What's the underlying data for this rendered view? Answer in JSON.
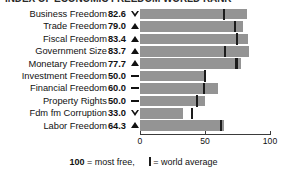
{
  "title": "INDEX OF ECONOMIC FREEDOM WORLD RANK",
  "footer": {
    "score_value": "100",
    "score_text": " = most free,",
    "legend_icon": "world-average-marker",
    "legend_text": "= world average"
  },
  "axis": {
    "min": 0,
    "max": 100,
    "ticks": [
      "0",
      "50",
      "100"
    ],
    "tick_values": [
      0,
      50,
      100
    ]
  },
  "chart_data": {
    "type": "bar",
    "title": "INDEX OF ECONOMIC FREEDOM WORLD RANK",
    "xlabel": "",
    "ylabel": "",
    "xlim": [
      0,
      100
    ],
    "grid": false,
    "legend": "100 = most free, | = world average",
    "orientation": "horizontal",
    "categories": [
      "Business Freedom",
      "Trade Freedom",
      "Fiscal Freedom",
      "Government Size",
      "Monetary Freedom",
      "Investment Freedom",
      "Financial Freedom",
      "Property Rights",
      "Fdm fm Corruption",
      "Labor Freedom"
    ],
    "values": [
      82.6,
      79.0,
      83.4,
      83.7,
      77.7,
      50.0,
      60.0,
      50.0,
      33.0,
      64.3
    ],
    "world_average": [
      64.6,
      73.1,
      74.9,
      65.2,
      74.2,
      50.0,
      49.0,
      43.6,
      40.3,
      62.1
    ],
    "trends": [
      "down",
      "up",
      "up",
      "up",
      "up",
      "flat",
      "flat",
      "flat",
      "down",
      "up"
    ],
    "rows": [
      {
        "label": "Business Freedom",
        "score": "82.6",
        "value": 82.6,
        "avg": 64.6,
        "trend": "down"
      },
      {
        "label": "Trade Freedom",
        "score": "79.0",
        "value": 79.0,
        "avg": 73.1,
        "trend": "up"
      },
      {
        "label": "Fiscal Freedom",
        "score": "83.4",
        "value": 83.4,
        "avg": 74.9,
        "trend": "up"
      },
      {
        "label": "Government Size",
        "score": "83.7",
        "value": 83.7,
        "avg": 65.2,
        "trend": "up"
      },
      {
        "label": "Monetary Freedom",
        "score": "77.7",
        "value": 77.7,
        "avg": 74.2,
        "trend": "up"
      },
      {
        "label": "Investment Freedom",
        "score": "50.0",
        "value": 50.0,
        "avg": 50.0,
        "trend": "flat"
      },
      {
        "label": "Financial Freedom",
        "score": "60.0",
        "value": 60.0,
        "avg": 49.0,
        "trend": "flat"
      },
      {
        "label": "Property Rights",
        "score": "50.0",
        "value": 50.0,
        "avg": 43.6,
        "trend": "flat"
      },
      {
        "label": "Fdm fm Corruption",
        "score": "33.0",
        "value": 33.0,
        "avg": 40.3,
        "trend": "down"
      },
      {
        "label": "Labor Freedom",
        "score": "64.3",
        "value": 64.3,
        "avg": 62.1,
        "trend": "up"
      }
    ],
    "colors": {
      "bar": "#949494",
      "marker": "#1c1c1c",
      "text": "#111111",
      "axis": "#3b3b3b",
      "background": "#ffffff"
    }
  }
}
